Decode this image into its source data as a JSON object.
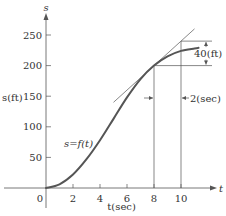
{
  "chart_data": {
    "type": "line",
    "title": "",
    "xlabel": "t(sec)",
    "ylabel": "s(ft)",
    "x_axis_name": "t",
    "y_axis_name": "s",
    "xlim": [
      0,
      12.5
    ],
    "ylim": [
      0,
      280
    ],
    "x_ticks": [
      2,
      4,
      6,
      8,
      10
    ],
    "x_tick_labels": [
      "2",
      "4",
      "6",
      "8",
      "10"
    ],
    "y_ticks": [
      50,
      100,
      150,
      200,
      250
    ],
    "y_tick_labels": [
      "50",
      "100",
      "150",
      "200",
      "250"
    ],
    "origin_label": "0",
    "grid": false,
    "series": [
      {
        "name": "s=f(t)",
        "x": [
          0,
          1,
          2,
          3,
          4,
          5,
          6,
          7,
          8,
          9,
          10,
          11,
          11.3
        ],
        "values": [
          0,
          6,
          22,
          47,
          78,
          113,
          148,
          178,
          200,
          215,
          224,
          228,
          229
        ]
      }
    ],
    "tangent_line": {
      "point": [
        8,
        200
      ],
      "slope": 20,
      "x_range": [
        5,
        11
      ]
    },
    "annotations": {
      "curve_label": "s=f(t)",
      "rise_label": "40(ft)",
      "run_label": "2(sec)",
      "run_x": [
        8,
        10
      ],
      "rise_y": [
        200,
        240
      ]
    },
    "colors": {
      "curve": "#555555",
      "axes": "#555555",
      "text": "#333333"
    }
  }
}
